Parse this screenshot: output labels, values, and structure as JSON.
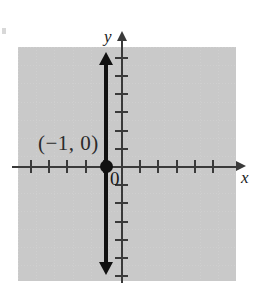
{
  "figure": {
    "type": "coordinate-plane-graph"
  },
  "axes": {
    "x_label": "x",
    "y_label": "y",
    "origin_label": "0",
    "x_ticks_left_of_origin": 4,
    "x_ticks_right_of_origin": 5,
    "y_ticks_above_origin": 6,
    "y_ticks_below_origin": 6,
    "x_arrow": "right",
    "y_arrow": "up"
  },
  "annotations": {
    "point_label": "(−1, 0)"
  },
  "chart_data": {
    "type": "line",
    "title": "",
    "xlabel": "x",
    "ylabel": "y",
    "grid": true,
    "legend": "none",
    "xlim": [
      -6,
      7
    ],
    "ylim": [
      -7,
      7
    ],
    "equation": "x = -1",
    "x": [
      -1,
      -1
    ],
    "y": [
      -7,
      7
    ],
    "series": [
      {
        "name": "x = -1",
        "points": [
          {
            "x": -1,
            "y": -7
          },
          {
            "x": -1,
            "y": 7
          }
        ],
        "arrows": [
          "up",
          "down"
        ],
        "color": "#111111"
      }
    ],
    "marked_points": [
      {
        "x": -1,
        "y": 0,
        "label": "(−1, 0)",
        "filled": true
      }
    ],
    "xticks": [
      -5,
      -4,
      -3,
      -2,
      -1,
      1,
      2,
      3,
      4,
      5
    ],
    "yticks": [
      -6,
      -5,
      -4,
      -3,
      -2,
      -1,
      1,
      2,
      3,
      4,
      5,
      6
    ]
  },
  "colors": {
    "axis": "#3a3a3a",
    "plot": "#111111",
    "grid": "#c9c9c9",
    "text": "#1a1a1a",
    "background": "#ffffff"
  }
}
